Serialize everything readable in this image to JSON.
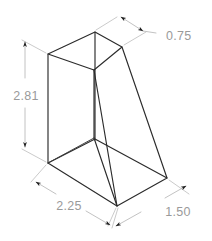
{
  "drawing": {
    "type": "isometric-technical-drawing",
    "object_name": "wedge-block",
    "background_color": "#ffffff",
    "edge_color": "#2b2b2b",
    "dimension_color": "#b3b3b3",
    "dimension_text_color": "#9a9a9a",
    "dimensions": [
      {
        "id": "top-width",
        "label": "0.75",
        "orientation": "isometric-top-right",
        "has_leader": true,
        "text_x": 166,
        "text_y": 37
      },
      {
        "id": "height",
        "label": "2.81",
        "orientation": "vertical-left",
        "has_leader": false,
        "text_x": 26,
        "text_y": 97
      },
      {
        "id": "base-length",
        "label": "2.25",
        "orientation": "isometric-bottom-left",
        "has_leader": false,
        "text_x": 69,
        "text_y": 207
      },
      {
        "id": "base-depth",
        "label": "1.50",
        "orientation": "isometric-bottom-right",
        "has_leader": false,
        "text_x": 178,
        "text_y": 213
      }
    ],
    "vertices": {
      "top_back": [
        95,
        32
      ],
      "top_left": [
        48,
        54
      ],
      "top_right": [
        122,
        47
      ],
      "top_front": [
        94,
        70
      ],
      "mid_front": [
        94,
        138
      ],
      "base_left": [
        48,
        163
      ],
      "base_front": [
        117,
        206
      ],
      "base_right": [
        167,
        178
      ],
      "base_back": [
        95,
        140
      ]
    }
  }
}
